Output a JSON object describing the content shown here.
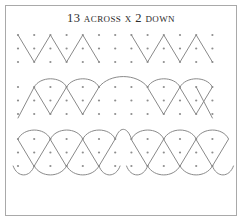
{
  "card": {
    "title": "13 across x 2 down",
    "width": 242,
    "height": 221,
    "background_color": "#ffffff",
    "border_color": "#a9a9a9",
    "dot_color": "#8e8e8e",
    "line_color": "#8a8a8a"
  },
  "chart_data": {
    "type": "scatter",
    "title": "13 across x 2 down",
    "xlabel": "",
    "ylabel": "",
    "grid": {
      "columns": 13,
      "bands": 3,
      "rows_per_band": 3,
      "total_rows": 9,
      "x_start": 13,
      "x_step": 16.2,
      "band_tops": [
        30,
        82,
        134
      ],
      "row_step": 13.5,
      "dot_radius": 1.1
    },
    "x": [
      13,
      29.2,
      45.4,
      61.6,
      77.8,
      94,
      110.2,
      126.4,
      142.6,
      158.8,
      175,
      191.2,
      207.4
    ],
    "y": [
      30,
      43.5,
      57,
      82,
      95.5,
      109,
      134,
      147.5,
      161
    ],
    "bands": [
      {
        "index": 1,
        "name": "zigzag-band",
        "motif": "zigzag",
        "description": "Straight-line zigzag running between the top and bottom dot rows of the band, drawn as two mirrored groups separated by a gap at the centre.",
        "groups": 2,
        "peaks_per_group": 2,
        "top_row_y": 30,
        "bottom_row_y": 57,
        "stroke_style": "straight"
      },
      {
        "index": 2,
        "name": "arc-loop-band",
        "motif": "arc-topped loops",
        "description": "Rounded arcs over the top dot row joined by straight diagonals that converge to points on the bottom dot row, forming petal or tulip shapes; two mirrored groups with a wide connecting arc over the centre gap.",
        "groups": 2,
        "loops_per_group": 2,
        "top_row_y": 82,
        "bottom_row_y": 109,
        "stroke_style": "curved"
      },
      {
        "index": 3,
        "name": "overlapping-petal-band",
        "motif": "overlapping petals",
        "description": "Larger interlaced loops whose arcs rise above the top dot row and dip below the bottom dot row, producing overlapping petal shapes; two mirrored groups with a gap at the centre.",
        "groups": 2,
        "loops_per_group": 3,
        "top_row_y": 134,
        "bottom_row_y": 161,
        "stroke_style": "curved-overlapping"
      }
    ],
    "legend": [],
    "grid_on": true
  }
}
